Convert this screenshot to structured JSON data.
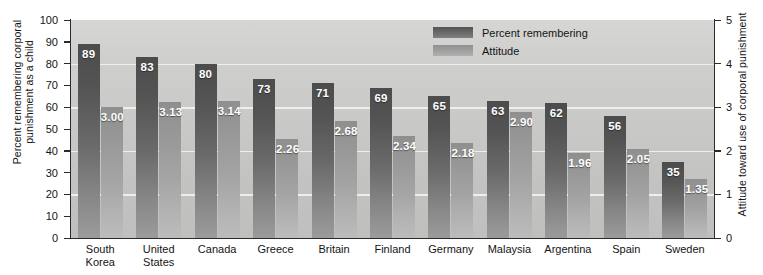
{
  "chart_data": {
    "type": "bar",
    "title": "",
    "subtitle": "",
    "categories": [
      "South Korea",
      "United States",
      "Canada",
      "Greece",
      "Britain",
      "Finland",
      "Germany",
      "Malaysia",
      "Argentina",
      "Spain",
      "Sweden"
    ],
    "category_lines": [
      [
        "South",
        "Korea"
      ],
      [
        "United",
        "States"
      ],
      [
        "Canada"
      ],
      [
        "Greece"
      ],
      [
        "Britain"
      ],
      [
        "Finland"
      ],
      [
        "Germany"
      ],
      [
        "Malaysia"
      ],
      [
        "Argentina"
      ],
      [
        "Spain"
      ],
      [
        "Sweden"
      ]
    ],
    "series": [
      {
        "name": "Percent remembering",
        "axis": "left",
        "color": "#6a6a6a",
        "values": [
          89,
          83,
          80,
          73,
          71,
          69,
          65,
          63,
          62,
          56,
          35
        ],
        "labels": [
          "89",
          "83",
          "80",
          "73",
          "71",
          "69",
          "65",
          "63",
          "62",
          "56",
          "35"
        ]
      },
      {
        "name": "Attitude",
        "axis": "right",
        "color": "#a4a4a4",
        "values": [
          3.0,
          3.13,
          3.14,
          2.26,
          2.68,
          2.34,
          2.18,
          2.9,
          1.96,
          2.05,
          1.35
        ],
        "labels": [
          "3.00",
          "3.13",
          "3.14",
          "2.26",
          "2.68",
          "2.34",
          "2.18",
          "2.90",
          "1.96",
          "2.05",
          "1.35"
        ]
      }
    ],
    "xlabel": "",
    "ylabel": "Percent remembering corporal punishment as a child",
    "y2label": "Attitude toward use of corporal punishment",
    "ylim": [
      0,
      100
    ],
    "y2lim": [
      0,
      5
    ],
    "yticks": [
      0,
      10,
      20,
      30,
      40,
      50,
      60,
      70,
      80,
      90,
      100
    ],
    "ytick_labels": [
      "0",
      "10",
      "20",
      "30",
      "40",
      "50",
      "60",
      "70",
      "80",
      "90",
      "100"
    ],
    "y2ticks": [
      0,
      1,
      2,
      3,
      4,
      5
    ],
    "y2tick_labels": [
      "0",
      "1",
      "2",
      "3",
      "4",
      "5"
    ],
    "gridlines": [
      20,
      40,
      60,
      80,
      100
    ],
    "grid": true,
    "legend_position": "top-right",
    "plot_background": "#c9c9c7"
  },
  "legend": {
    "items": [
      {
        "label": "Percent remembering",
        "swatch": "pct"
      },
      {
        "label": "Attitude",
        "swatch": "att"
      }
    ]
  },
  "axes": {
    "left_title": "Percent remembering corporal punishment as a child",
    "right_title": "Attitude toward use of corporal punishment"
  }
}
